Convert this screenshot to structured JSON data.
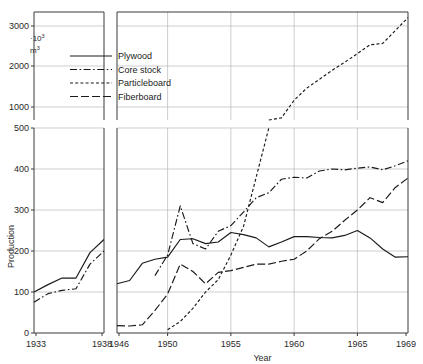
{
  "chart_data": {
    "type": "line",
    "title": "",
    "xlabel": "Year",
    "ylabel": "Production",
    "unit_label": "·10³ m³",
    "unit_main": "m",
    "unit_exp": "3",
    "unit_prefix": "·10",
    "unit_prefix_exp": "3",
    "grid": true,
    "legend_position": "upper-left-inside",
    "axis_note": "broken x-axis (1933-1938 | 1946-1969); broken y-axis (linear 0-500 lower, log-like 500-3000 upper)",
    "y_ticks_lower": [
      0,
      100,
      200,
      300,
      400,
      500
    ],
    "y_ticks_upper": [
      1000,
      2000,
      3000
    ],
    "ylim_lower": [
      0,
      500
    ],
    "ylim_upper": [
      500,
      3400
    ],
    "x_ticks_left": [
      1933,
      1938
    ],
    "x_ticks_right": [
      1946,
      1950,
      1955,
      1960,
      1965,
      1969
    ],
    "xlim_left": [
      1933,
      1938
    ],
    "xlim_right": [
      1946,
      1969
    ],
    "series": [
      {
        "name": "Plywood",
        "style": "solid",
        "color": "#1a1a1a",
        "segment_left": {
          "x": [
            1933,
            1934,
            1935,
            1936,
            1937,
            1938
          ],
          "values": [
            100,
            118,
            134,
            134,
            196,
            228
          ]
        },
        "segment_right": {
          "x": [
            1946,
            1947,
            1948,
            1949,
            1950,
            1951,
            1952,
            1953,
            1954,
            1955,
            1956,
            1957,
            1958,
            1959,
            1960,
            1961,
            1962,
            1963,
            1964,
            1965,
            1966,
            1967,
            1968,
            1969
          ],
          "values": [
            120,
            128,
            170,
            180,
            185,
            228,
            230,
            218,
            222,
            245,
            240,
            232,
            210,
            222,
            235,
            235,
            233,
            232,
            238,
            250,
            232,
            205,
            185,
            186
          ]
        }
      },
      {
        "name": "Core stock",
        "style": "dash-dot",
        "color": "#1a1a1a",
        "segment_left": {
          "x": [
            1933,
            1934,
            1935,
            1936,
            1937,
            1938
          ],
          "values": [
            75,
            96,
            104,
            108,
            168,
            200
          ]
        },
        "segment_right": {
          "x": [
            1949,
            1950,
            1951,
            1952,
            1953,
            1954,
            1955,
            1956,
            1957,
            1958,
            1959,
            1960,
            1961,
            1962,
            1963,
            1964,
            1965,
            1966,
            1967,
            1968,
            1969
          ],
          "values": [
            140,
            190,
            310,
            218,
            205,
            248,
            262,
            295,
            330,
            342,
            375,
            380,
            378,
            395,
            400,
            398,
            402,
            405,
            398,
            408,
            420
          ]
        }
      },
      {
        "name": "Particleboard",
        "style": "dashed-fine",
        "color": "#1a1a1a",
        "segment_right": {
          "x": [
            1950,
            1951,
            1952,
            1953,
            1954,
            1955,
            1956,
            1957,
            1958,
            1959,
            1960,
            1961,
            1962,
            1963,
            1964,
            1965,
            1966,
            1967,
            1968,
            1969
          ],
          "values": [
            8,
            28,
            60,
            100,
            130,
            190,
            260,
            380,
            500,
            520,
            720,
            900,
            1060,
            1250,
            1450,
            1700,
            2000,
            2050,
            2600,
            3300
          ]
        }
      },
      {
        "name": "Fiberboard",
        "style": "long-dash",
        "color": "#1a1a1a",
        "segment_right": {
          "x": [
            1946,
            1947,
            1948,
            1949,
            1950,
            1951,
            1952,
            1953,
            1954,
            1955,
            1956,
            1957,
            1958,
            1959,
            1960,
            1961,
            1962,
            1963,
            1964,
            1965,
            1966,
            1967,
            1968,
            1969
          ],
          "values": [
            18,
            17,
            20,
            55,
            95,
            168,
            150,
            120,
            148,
            152,
            160,
            168,
            168,
            175,
            180,
            200,
            230,
            248,
            275,
            300,
            330,
            318,
            355,
            378
          ]
        }
      }
    ]
  },
  "legend": {
    "items": [
      {
        "label": "Plywood"
      },
      {
        "label": "Core stock"
      },
      {
        "label": "Particleboard"
      },
      {
        "label": "Fiberboard"
      }
    ]
  },
  "axes": {
    "y_title": "Production",
    "x_title": "Year"
  }
}
